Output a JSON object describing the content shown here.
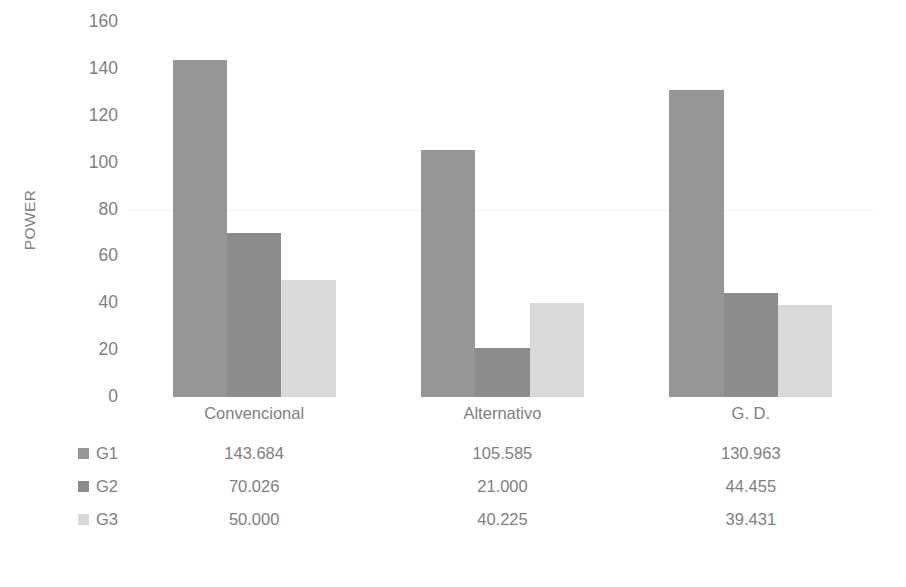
{
  "chart_data": {
    "type": "bar",
    "title": "",
    "xlabel": "",
    "ylabel": "POWER",
    "ylim": [
      0,
      160
    ],
    "yticks": [
      160,
      140,
      120,
      100,
      80,
      60,
      40,
      20,
      0
    ],
    "grid": true,
    "legend_position": "bottom-table",
    "categories": [
      "Convencional",
      "Alternativo",
      "G. D."
    ],
    "series": [
      {
        "name": "G1",
        "color": "#969696",
        "values": [
          143.684,
          105.585,
          130.963
        ],
        "labels": [
          "143.684",
          "105.585",
          "130.963"
        ]
      },
      {
        "name": "G2",
        "color": "#8c8c8c",
        "values": [
          70.026,
          21.0,
          44.455
        ],
        "labels": [
          "70.026",
          "21.000",
          "44.455"
        ]
      },
      {
        "name": "G3",
        "color": "#d9d9d9",
        "values": [
          50.0,
          40.225,
          39.431
        ],
        "labels": [
          "50.000",
          "40.225",
          "39.431"
        ]
      }
    ]
  },
  "axis": {
    "ylabel": "POWER",
    "tick_160": "160",
    "tick_140": "140",
    "tick_120": "120",
    "tick_100": "100",
    "tick_80": "80",
    "tick_60": "60",
    "tick_40": "40",
    "tick_20": "20",
    "tick_0": "0"
  },
  "category_labels": {
    "c0": "Convencional",
    "c1": "Alternativo",
    "c2": "G. D."
  },
  "table": {
    "rows": [
      {
        "name": "G1",
        "v0": "143.684",
        "v1": "105.585",
        "v2": "130.963"
      },
      {
        "name": "G2",
        "v0": "70.026",
        "v1": "21.000",
        "v2": "44.455"
      },
      {
        "name": "G3",
        "v0": "50.000",
        "v1": "40.225",
        "v2": "39.431"
      }
    ]
  },
  "colors": {
    "g1": "#969696",
    "g2": "#8c8c8c",
    "g3": "#d9d9d9",
    "text": "#808080",
    "grid": "#f2f2f2",
    "background": "#ffffff"
  }
}
